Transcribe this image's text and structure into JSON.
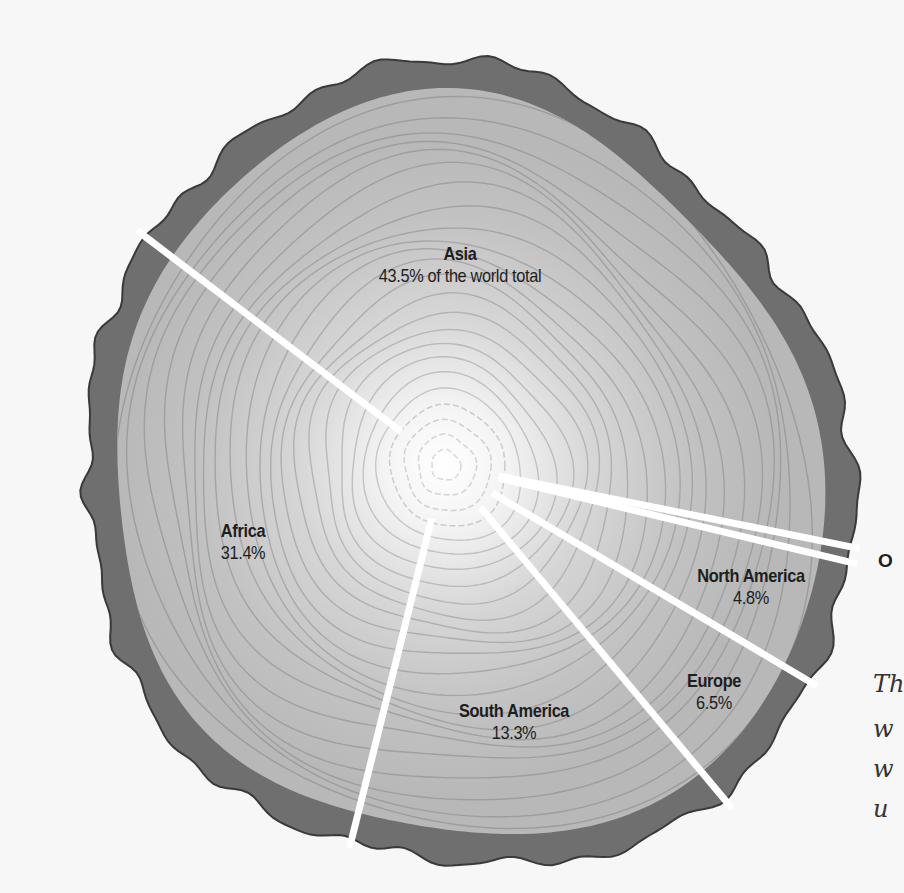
{
  "chart_data": {
    "type": "pie",
    "style": "tree-stump pie chart (cross-section of tree trunk with growth rings)",
    "title": "",
    "unit": "% of the world total",
    "slices": [
      {
        "label": "Asia",
        "value": 43.5,
        "display": "43.5% of the world total"
      },
      {
        "label": "Africa",
        "value": 31.4,
        "display": "31.4%"
      },
      {
        "label": "South America",
        "value": 13.3,
        "display": "13.3%"
      },
      {
        "label": "Europe",
        "value": 6.5,
        "display": "6.5%"
      },
      {
        "label": "North America",
        "value": 4.8,
        "display": "4.8%"
      },
      {
        "label": "O",
        "value": 0.5,
        "display": "",
        "note": "label cut off at right edge"
      }
    ],
    "legend": "none (direct labels)",
    "colors": {
      "bark": "#6f6f6f",
      "bark_outline": "#3a3a3a",
      "wood": "#bdbdbd",
      "rings": "#9a9a9a",
      "center": "#ffffff",
      "cuts": "#ffffff"
    }
  },
  "labels": {
    "asia_name": "Asia",
    "asia_value": "43.5% of the world total",
    "africa_name": "Africa",
    "africa_value": "31.4%",
    "south_america_name": "South America",
    "south_america_value": "13.3%",
    "europe_name": "Europe",
    "europe_value": "6.5%",
    "north_america_name": "North America",
    "north_america_value": "4.8%",
    "edge_label": "O"
  },
  "caption": {
    "line1": "Th",
    "line2": "w",
    "line3": "w",
    "line4": "u"
  }
}
